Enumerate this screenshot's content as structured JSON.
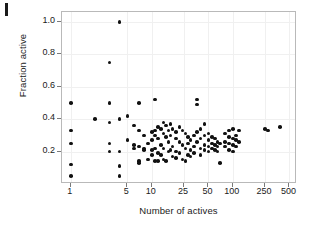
{
  "figure": {
    "panel_mark": "I",
    "background": "#ffffff",
    "point_color": "#111111",
    "frame_color": "#b9b9b9",
    "grid_color": "#f0f0f0"
  },
  "chart_data": {
    "type": "scatter",
    "title": "",
    "xlabel": "Number of actives",
    "ylabel": "Fraction active",
    "xscale": "log",
    "yscale": "linear",
    "xlim": [
      0.78,
      620
    ],
    "ylim": [
      0.0,
      1.06
    ],
    "grid": true,
    "legend": null,
    "xticks": [
      1,
      5,
      10,
      25,
      50,
      100,
      250,
      500
    ],
    "xticklabels": [
      "1",
      "5",
      "10",
      "25",
      "50",
      "100",
      "250",
      "500"
    ],
    "yticks": [
      0.2,
      0.4,
      0.6,
      0.8,
      1.0
    ],
    "yticklabels": [
      "0.2",
      "0.4",
      "0.6",
      "0.8",
      "1.0"
    ],
    "series": [
      {
        "name": "datasets",
        "marker": "circle",
        "color": "#111111",
        "points": [
          [
            1,
            0.5
          ],
          [
            1,
            0.33
          ],
          [
            1,
            0.25
          ],
          [
            1,
            0.12
          ],
          [
            1,
            0.05
          ],
          [
            2,
            0.4
          ],
          [
            3,
            0.75
          ],
          [
            3,
            0.5
          ],
          [
            3,
            0.38
          ],
          [
            3,
            0.25
          ],
          [
            3,
            0.2
          ],
          [
            4,
            1.0
          ],
          [
            4,
            0.4
          ],
          [
            4,
            0.2
          ],
          [
            4,
            0.11
          ],
          [
            4,
            0.05
          ],
          [
            5,
            0.42
          ],
          [
            5,
            0.27
          ],
          [
            6,
            0.36
          ],
          [
            6,
            0.24
          ],
          [
            6,
            0.22
          ],
          [
            7,
            0.5
          ],
          [
            7,
            0.33
          ],
          [
            7,
            0.23
          ],
          [
            7,
            0.14
          ],
          [
            7,
            0.13
          ],
          [
            8,
            0.3
          ],
          [
            8,
            0.22
          ],
          [
            8,
            0.21
          ],
          [
            9,
            0.25
          ],
          [
            9,
            0.15
          ],
          [
            10,
            0.32
          ],
          [
            10,
            0.27
          ],
          [
            10,
            0.21
          ],
          [
            10,
            0.18
          ],
          [
            11,
            0.52
          ],
          [
            11,
            0.33
          ],
          [
            11,
            0.3
          ],
          [
            11,
            0.22
          ],
          [
            11,
            0.14
          ],
          [
            12,
            0.35
          ],
          [
            12,
            0.28
          ],
          [
            12,
            0.19
          ],
          [
            12,
            0.14
          ],
          [
            13,
            0.34
          ],
          [
            13,
            0.24
          ],
          [
            13,
            0.18
          ],
          [
            14,
            0.38
          ],
          [
            14,
            0.31
          ],
          [
            14,
            0.22
          ],
          [
            14,
            0.15
          ],
          [
            15,
            0.36
          ],
          [
            15,
            0.29
          ],
          [
            15,
            0.14
          ],
          [
            16,
            0.33
          ],
          [
            16,
            0.26
          ],
          [
            16,
            0.2
          ],
          [
            17,
            0.37
          ],
          [
            17,
            0.3
          ],
          [
            17,
            0.21
          ],
          [
            18,
            0.34
          ],
          [
            18,
            0.23
          ],
          [
            18,
            0.17
          ],
          [
            20,
            0.32
          ],
          [
            20,
            0.28
          ],
          [
            20,
            0.2
          ],
          [
            20,
            0.16
          ],
          [
            22,
            0.35
          ],
          [
            22,
            0.26
          ],
          [
            22,
            0.19
          ],
          [
            24,
            0.33
          ],
          [
            24,
            0.24
          ],
          [
            24,
            0.15
          ],
          [
            26,
            0.31
          ],
          [
            26,
            0.22
          ],
          [
            26,
            0.14
          ],
          [
            28,
            0.29
          ],
          [
            28,
            0.25
          ],
          [
            28,
            0.18
          ],
          [
            30,
            0.27
          ],
          [
            30,
            0.21
          ],
          [
            30,
            0.17
          ],
          [
            33,
            0.3
          ],
          [
            33,
            0.23
          ],
          [
            33,
            0.19
          ],
          [
            36,
            0.52
          ],
          [
            36,
            0.49
          ],
          [
            36,
            0.32
          ],
          [
            36,
            0.26
          ],
          [
            40,
            0.34
          ],
          [
            40,
            0.28
          ],
          [
            40,
            0.22
          ],
          [
            40,
            0.18
          ],
          [
            45,
            0.37
          ],
          [
            45,
            0.3
          ],
          [
            45,
            0.24
          ],
          [
            45,
            0.21
          ],
          [
            50,
            0.31
          ],
          [
            50,
            0.27
          ],
          [
            50,
            0.23
          ],
          [
            50,
            0.2
          ],
          [
            55,
            0.29
          ],
          [
            55,
            0.25
          ],
          [
            55,
            0.22
          ],
          [
            60,
            0.28
          ],
          [
            60,
            0.24
          ],
          [
            60,
            0.21
          ],
          [
            65,
            0.26
          ],
          [
            65,
            0.23
          ],
          [
            65,
            0.2
          ],
          [
            70,
            0.25
          ],
          [
            70,
            0.13
          ],
          [
            80,
            0.31
          ],
          [
            80,
            0.26
          ],
          [
            80,
            0.23
          ],
          [
            90,
            0.33
          ],
          [
            90,
            0.29
          ],
          [
            90,
            0.25
          ],
          [
            90,
            0.21
          ],
          [
            100,
            0.34
          ],
          [
            100,
            0.28
          ],
          [
            100,
            0.24
          ],
          [
            100,
            0.2
          ],
          [
            110,
            0.3
          ],
          [
            110,
            0.27
          ],
          [
            110,
            0.23
          ],
          [
            120,
            0.33
          ],
          [
            120,
            0.26
          ],
          [
            250,
            0.34
          ],
          [
            270,
            0.33
          ],
          [
            380,
            0.35
          ]
        ]
      }
    ]
  }
}
